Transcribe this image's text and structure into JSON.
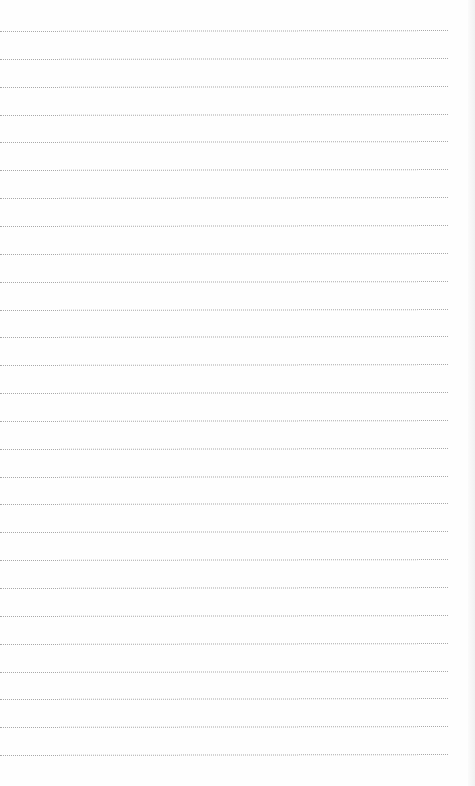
{
  "page": {
    "type": "ruled-notepad",
    "background_color": "#fefefe",
    "line_color": "#a9a9a9",
    "line_style": "dotted",
    "line_width_px": 448,
    "first_line_y": 31,
    "line_spacing_px": 27.85,
    "line_count": 27,
    "text": ""
  }
}
